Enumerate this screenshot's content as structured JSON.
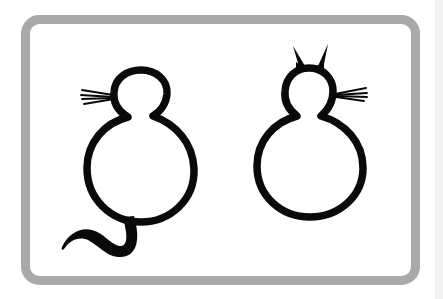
{
  "figure": {
    "frame": {
      "color": "#a9a9a9",
      "background": "#ffffff"
    },
    "ink_color": "#0a0a0a",
    "glyphs": [
      {
        "name": "cat-with-tail",
        "features": [
          "head",
          "body",
          "whiskers-left",
          "tail"
        ]
      },
      {
        "name": "cat-with-ears",
        "features": [
          "ears",
          "head",
          "body",
          "whiskers-right"
        ]
      }
    ]
  }
}
